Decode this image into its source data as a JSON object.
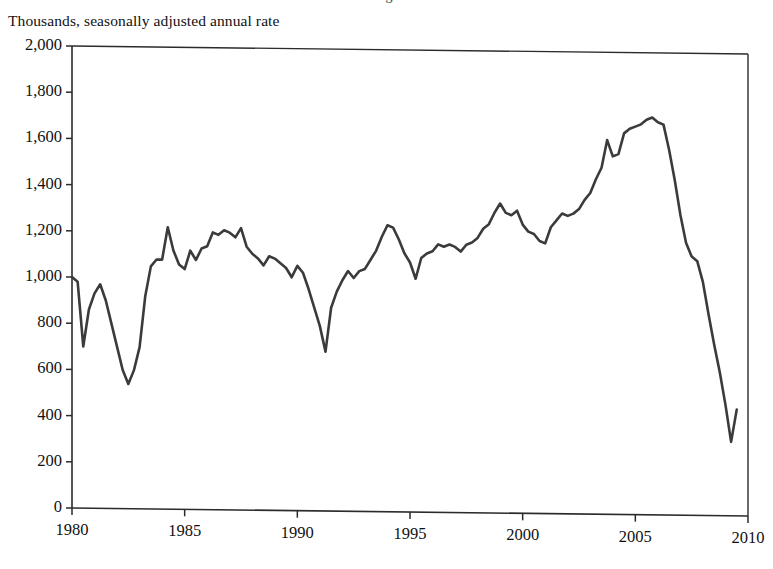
{
  "figure": {
    "units_label": "Thousands, seasonally adjusted annual rate",
    "clipped_title": "Housing Starts",
    "line_color": "#3b3b3b",
    "axis_color": "#2b2b2b",
    "background_color": "#ffffff"
  },
  "chart_data": {
    "type": "line",
    "title": "Housing Starts",
    "subtitle": "Thousands, seasonally adjusted annual rate",
    "xlabel": "",
    "ylabel": "Thousands, seasonally adjusted annual rate",
    "xlim": [
      1980,
      2010
    ],
    "ylim": [
      0,
      2000
    ],
    "grid": false,
    "legend": "none",
    "xticks": [
      1980,
      1985,
      1990,
      1995,
      2000,
      2005,
      2010
    ],
    "xtick_labels": [
      "1980",
      "1985",
      "1990",
      "1995",
      "2000",
      "2005",
      "2010"
    ],
    "yticks": [
      0,
      200,
      400,
      600,
      800,
      1000,
      1200,
      1400,
      1600,
      1800,
      2000
    ],
    "ytick_labels": [
      "0",
      "200",
      "400",
      "600",
      "800",
      "1,000",
      "1,200",
      "1,400",
      "1,600",
      "1,800",
      "2,000"
    ],
    "series": [
      {
        "name": "Housing starts",
        "color": "#3b3b3b",
        "x": [
          1980.0,
          1980.25,
          1980.5,
          1980.75,
          1981.0,
          1981.25,
          1981.5,
          1981.75,
          1982.0,
          1982.25,
          1982.5,
          1982.75,
          1983.0,
          1983.25,
          1983.5,
          1983.75,
          1984.0,
          1984.25,
          1984.5,
          1984.75,
          1985.0,
          1985.25,
          1985.5,
          1985.75,
          1986.0,
          1986.25,
          1986.5,
          1986.75,
          1987.0,
          1987.25,
          1987.5,
          1987.75,
          1988.0,
          1988.25,
          1988.5,
          1988.75,
          1989.0,
          1989.25,
          1989.5,
          1989.75,
          1990.0,
          1990.25,
          1990.5,
          1990.75,
          1991.0,
          1991.25,
          1991.5,
          1991.75,
          1992.0,
          1992.25,
          1992.5,
          1992.75,
          1993.0,
          1993.25,
          1993.5,
          1993.75,
          1994.0,
          1994.25,
          1994.5,
          1994.75,
          1995.0,
          1995.25,
          1995.5,
          1995.75,
          1996.0,
          1996.25,
          1996.5,
          1996.75,
          1997.0,
          1997.25,
          1997.5,
          1997.75,
          1998.0,
          1998.25,
          1998.5,
          1998.75,
          1999.0,
          1999.25,
          1999.5,
          1999.75,
          2000.0,
          2000.25,
          2000.5,
          2000.75,
          2001.0,
          2001.25,
          2001.5,
          2001.75,
          2002.0,
          2002.25,
          2002.5,
          2002.75,
          2003.0,
          2003.25,
          2003.5,
          2003.75,
          2004.0,
          2004.25,
          2004.5,
          2004.75,
          2005.0,
          2005.25,
          2005.5,
          2005.75,
          2006.0,
          2006.25,
          2006.5,
          2006.75,
          2007.0,
          2007.25,
          2007.5,
          2007.75,
          2008.0,
          2008.25,
          2008.5,
          2008.75,
          2009.0,
          2009.25,
          2009.5
        ],
        "values": [
          1000,
          980,
          700,
          860,
          930,
          970,
          900,
          800,
          700,
          600,
          540,
          600,
          700,
          920,
          1050,
          1080,
          1080,
          1220,
          1120,
          1060,
          1040,
          1120,
          1080,
          1130,
          1140,
          1200,
          1190,
          1210,
          1200,
          1180,
          1220,
          1140,
          1110,
          1090,
          1060,
          1100,
          1090,
          1070,
          1050,
          1010,
          1060,
          1030,
          960,
          880,
          800,
          690,
          880,
          950,
          1000,
          1040,
          1010,
          1040,
          1050,
          1090,
          1130,
          1190,
          1240,
          1230,
          1180,
          1120,
          1080,
          1010,
          1100,
          1120,
          1130,
          1160,
          1150,
          1160,
          1150,
          1130,
          1160,
          1170,
          1190,
          1230,
          1250,
          1300,
          1340,
          1300,
          1290,
          1310,
          1250,
          1220,
          1210,
          1180,
          1170,
          1240,
          1270,
          1300,
          1290,
          1300,
          1320,
          1360,
          1390,
          1450,
          1500,
          1620,
          1550,
          1560,
          1650,
          1670,
          1680,
          1690,
          1710,
          1720,
          1700,
          1690,
          1580,
          1450,
          1300,
          1180,
          1120,
          1100,
          1010,
          870,
          740,
          620,
          480,
          320,
          460
        ]
      }
    ],
    "notes": [
      "Peak of about 1,720 thousand in early 2006.",
      "Trough of about 320 thousand in early 2009.",
      "Recession trough of about 540 thousand in 1982.",
      "Trough of about 690 thousand in 1991."
    ]
  },
  "geometry": {
    "plot_left_px": 72,
    "plot_right_px": 748,
    "plot_top_px": 46,
    "plot_bottom_px": 508,
    "skew_px": 8
  }
}
